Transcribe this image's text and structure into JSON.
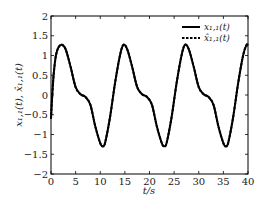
{
  "chart_data": {
    "type": "line",
    "title": "",
    "xlabel": "t/s",
    "ylabel": "x_{1,1}(t), x̂_{1,1}(t)",
    "xlim": [
      0,
      40
    ],
    "ylim": [
      -2,
      2
    ],
    "xticks": [
      0,
      5,
      10,
      15,
      20,
      25,
      30,
      35,
      40
    ],
    "xtick_labels": [
      "0",
      "5",
      "10",
      "15",
      "20",
      "25",
      "30",
      "35",
      "40"
    ],
    "yticks": [
      2,
      1.5,
      1,
      0.5,
      0,
      -0.5,
      -1,
      -1.5,
      -2
    ],
    "ytick_labels": [
      "2",
      "1.5",
      "1",
      "0.5",
      "0",
      "−0.5",
      "−1",
      "−1.5",
      "−2"
    ],
    "grid": false,
    "legend_position": "upper right",
    "series": [
      {
        "name": "x_{1,1}(t)",
        "style": "solid",
        "color": "#000000",
        "x": [
          0,
          0.3,
          0.6,
          1.0,
          1.5,
          2.2,
          3.0,
          4.0,
          5.0,
          6.0,
          7.0,
          8.0,
          9.0,
          10.0,
          10.5,
          11.0,
          12.0,
          13.0,
          14.0,
          14.7,
          15.5,
          16.5,
          17.5,
          18.5,
          19.5,
          20.5,
          21.5,
          22.5,
          23.0,
          23.5,
          24.5,
          25.5,
          26.5,
          27.2,
          28.0,
          29.0,
          30.0,
          31.0,
          32.0,
          33.0,
          34.0,
          35.0,
          35.5,
          36.0,
          37.0,
          38.0,
          39.0,
          39.7,
          40.0
        ],
        "y": [
          -0.6,
          0.1,
          0.6,
          1.0,
          1.2,
          1.27,
          1.15,
          0.7,
          0.2,
          0.02,
          -0.05,
          -0.25,
          -0.8,
          -1.22,
          -1.3,
          -1.2,
          -0.55,
          0.3,
          1.0,
          1.27,
          1.15,
          0.7,
          0.2,
          0.02,
          -0.05,
          -0.25,
          -0.8,
          -1.22,
          -1.3,
          -1.2,
          -0.55,
          0.3,
          1.0,
          1.27,
          1.15,
          0.7,
          0.2,
          0.02,
          -0.05,
          -0.25,
          -0.8,
          -1.22,
          -1.3,
          -1.2,
          -0.55,
          0.3,
          1.0,
          1.27,
          1.25
        ]
      },
      {
        "name": "x̂_{1,1}(t)",
        "style": "dashed",
        "color": "#000000",
        "x": [
          0,
          0.3,
          0.6,
          1.0,
          1.5,
          2.2,
          3.0,
          4.0,
          5.0,
          6.0,
          7.0,
          8.0,
          9.0,
          10.0,
          10.5,
          11.0,
          12.0,
          13.0,
          14.0,
          14.7,
          15.5,
          16.5,
          17.5,
          18.5,
          19.5,
          20.5,
          21.5,
          22.5,
          23.0,
          23.5,
          24.5,
          25.5,
          26.5,
          27.2,
          28.0,
          29.0,
          30.0,
          31.0,
          32.0,
          33.0,
          34.0,
          35.0,
          35.5,
          36.0,
          37.0,
          38.0,
          39.0,
          39.7,
          40.0
        ],
        "y": [
          -0.6,
          0.1,
          0.6,
          1.0,
          1.2,
          1.27,
          1.15,
          0.7,
          0.2,
          0.02,
          -0.05,
          -0.25,
          -0.8,
          -1.22,
          -1.3,
          -1.2,
          -0.55,
          0.3,
          1.0,
          1.27,
          1.15,
          0.7,
          0.2,
          0.02,
          -0.05,
          -0.25,
          -0.8,
          -1.22,
          -1.3,
          -1.2,
          -0.55,
          0.3,
          1.0,
          1.27,
          1.15,
          0.7,
          0.2,
          0.02,
          -0.05,
          -0.25,
          -0.8,
          -1.22,
          -1.3,
          -1.2,
          -0.55,
          0.3,
          1.0,
          1.27,
          1.25
        ]
      }
    ]
  },
  "legend": {
    "items": [
      {
        "label": "x₁,₁(t)",
        "style": "solid"
      },
      {
        "label": "x̂₁,₁(t)",
        "style": "dashed"
      }
    ]
  },
  "axes": {
    "xlabel": "t/s",
    "ylabel": "x₁,₁(t), x̂₁,₁(t)"
  }
}
